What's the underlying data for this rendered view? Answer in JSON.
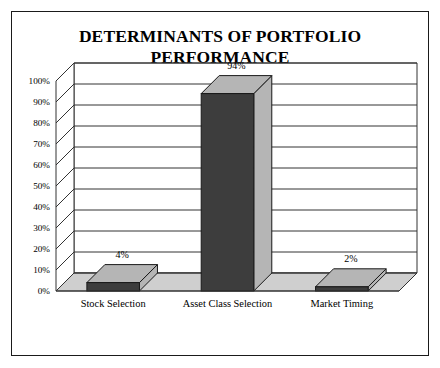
{
  "figure": {
    "title": "DETERMINANTS OF PORTFOLIO PERFORMANCE",
    "border_color": "#1a1a1a",
    "background": "#ffffff"
  },
  "chart_data": {
    "type": "bar",
    "title": "DETERMINANTS OF PORTFOLIO PERFORMANCE",
    "xlabel": "",
    "ylabel": "",
    "categories": [
      "Stock Selection",
      "Asset Class Selection",
      "Market Timing"
    ],
    "values": [
      4,
      94,
      2
    ],
    "value_labels": [
      "4%",
      "94%",
      "2%"
    ],
    "ylim": [
      0,
      100
    ],
    "ytick_values": [
      0,
      10,
      20,
      30,
      40,
      50,
      60,
      70,
      80,
      90,
      100
    ],
    "ytick_labels": [
      "0%",
      "10%",
      "20%",
      "30%",
      "40%",
      "50%",
      "60%",
      "70%",
      "80%",
      "90%",
      "100%"
    ],
    "grid": true,
    "legend": false,
    "style": "3d",
    "colors": {
      "bar_front": "#3d3d3d",
      "bar_top": "#b5b5b5",
      "bar_side": "#b5b5b5",
      "floor": "#cfcfcf",
      "wall": "#ffffff",
      "gridline": "#333333",
      "outline": "#1a1a1a"
    }
  }
}
